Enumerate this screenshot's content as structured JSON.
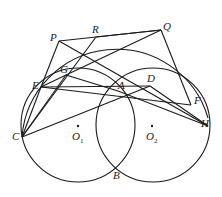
{
  "diagram": {
    "type": "geometry",
    "points": {
      "P": {
        "x": 59,
        "y": 41
      },
      "R": {
        "x": 96,
        "y": 37
      },
      "Q": {
        "x": 161,
        "y": 30
      },
      "G": {
        "x": 66,
        "y": 75
      },
      "E": {
        "x": 41,
        "y": 87
      },
      "A": {
        "x": 118,
        "y": 91
      },
      "D": {
        "x": 150,
        "y": 86
      },
      "F": {
        "x": 191,
        "y": 105
      },
      "H": {
        "x": 208,
        "y": 126
      },
      "C": {
        "x": 22,
        "y": 137
      },
      "B": {
        "x": 117,
        "y": 167
      },
      "O1": {
        "x": 78,
        "y": 133
      },
      "O2": {
        "x": 152,
        "y": 133
      }
    },
    "labels": {
      "P": "P",
      "R": "R",
      "Q": "Q",
      "G": "G",
      "E": "E",
      "A": "A",
      "D": "D",
      "F": "F",
      "H": "H",
      "C": "C",
      "B": "B",
      "O1_main": "O",
      "O1_sub": "1",
      "O2_main": "O",
      "O2_sub": "2"
    },
    "circles": [
      {
        "name": "big-circle",
        "through": [
          "P",
          "Q",
          "E",
          "C",
          "F"
        ]
      },
      {
        "name": "circle-O1",
        "center": "O1",
        "through": [
          "E",
          "G",
          "A",
          "B",
          "C"
        ]
      },
      {
        "name": "circle-O2",
        "center": "O2",
        "through": [
          "A",
          "D",
          "F",
          "H",
          "B"
        ]
      }
    ],
    "segments": [
      [
        "P",
        "Q"
      ],
      [
        "P",
        "E"
      ],
      [
        "P",
        "H"
      ],
      [
        "R",
        "Q"
      ],
      [
        "R",
        "C"
      ],
      [
        "Q",
        "F"
      ],
      [
        "Q",
        "G"
      ],
      [
        "E",
        "G"
      ],
      [
        "E",
        "F"
      ],
      [
        "G",
        "A"
      ],
      [
        "E",
        "A"
      ],
      [
        "A",
        "D"
      ],
      [
        "A",
        "F"
      ],
      [
        "A",
        "H"
      ],
      [
        "D",
        "F"
      ],
      [
        "D",
        "H"
      ],
      [
        "C",
        "A"
      ],
      [
        "C",
        "E"
      ],
      [
        "C",
        "G"
      ],
      [
        "E",
        "D"
      ]
    ]
  }
}
